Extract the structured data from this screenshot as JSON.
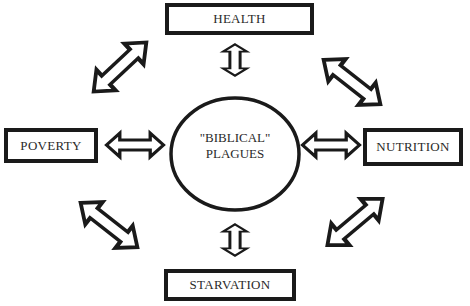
{
  "diagram": {
    "center": {
      "line1": "\"BIBLICAL\"",
      "line2": "PLAGUES"
    },
    "nodes": {
      "top": "HEALTH",
      "left": "POVERTY",
      "right": "NUTRITION",
      "bottom": "STARVATION"
    },
    "connectors": [
      "health-center-bidirectional",
      "poverty-center-bidirectional",
      "nutrition-center-bidirectional",
      "starvation-center-bidirectional",
      "health-poverty-bidirectional",
      "health-nutrition-bidirectional",
      "poverty-starvation-bidirectional",
      "nutrition-starvation-bidirectional"
    ],
    "colors": {
      "stroke": "#1a1a1a",
      "background": "#ffffff"
    }
  }
}
